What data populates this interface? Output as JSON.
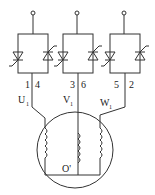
{
  "diagram": {
    "type": "three-phase thyristor AC voltage controller with star-connected motor",
    "phases": [
      {
        "name": "U",
        "terminal_labels": [
          "1",
          "4"
        ],
        "motor_label": "U",
        "motor_label_sub": "1"
      },
      {
        "name": "V",
        "terminal_labels": [
          "3",
          "6"
        ],
        "motor_label": "V",
        "motor_label_sub": "1"
      },
      {
        "name": "W",
        "terminal_labels": [
          "5",
          "2"
        ],
        "motor_label": "W",
        "motor_label_sub": "1"
      }
    ],
    "neutral_label": "O'",
    "colors": {
      "line": "#333333",
      "background": "#ffffff"
    }
  }
}
